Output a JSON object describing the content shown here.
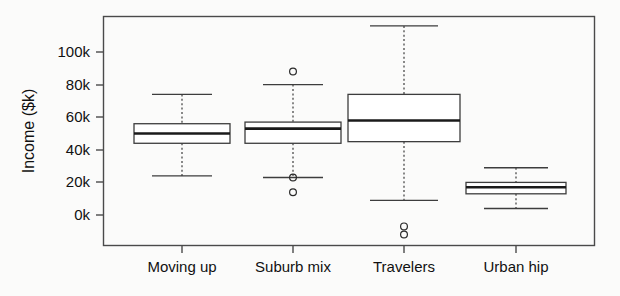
{
  "chart_data": {
    "type": "box",
    "title": "",
    "xlabel": "",
    "ylabel": "Income ($k)",
    "categories": [
      "Moving up",
      "Suburb mix",
      "Travelers",
      "Urban hip"
    ],
    "ylim": [
      -15000,
      120000
    ],
    "yticks": [
      0,
      20000,
      40000,
      60000,
      80000,
      100000
    ],
    "ytick_labels": [
      "0k",
      "20k",
      "40k",
      "60k",
      "80k",
      "100k"
    ],
    "grid": false,
    "legend": null,
    "boxes": [
      {
        "name": "Moving up",
        "whisker_low": 24000,
        "q1": 44000,
        "median": 50000,
        "q3": 56000,
        "whisker_high": 74000,
        "outliers": []
      },
      {
        "name": "Suburb mix",
        "whisker_low": 23000,
        "q1": 44000,
        "median": 53000,
        "q3": 57000,
        "whisker_high": 80000,
        "outliers": [
          88000,
          23000,
          14000
        ]
      },
      {
        "name": "Travelers",
        "whisker_low": 9000,
        "q1": 45000,
        "median": 58000,
        "q3": 74000,
        "whisker_high": 116000,
        "outliers": [
          -7000,
          -12000
        ]
      },
      {
        "name": "Urban hip",
        "whisker_low": 4000,
        "q1": 13000,
        "median": 17000,
        "q3": 20000,
        "whisker_high": 29000,
        "outliers": []
      }
    ]
  },
  "axes": {
    "y_label": "Income ($k)",
    "y_tick_labels": [
      "100k",
      "80k",
      "60k",
      "40k",
      "20k",
      "0k"
    ],
    "x_tick_labels": [
      "Moving up",
      "Suburb mix",
      "Travelers",
      "Urban hip"
    ]
  },
  "colors": {
    "background": "#fbfbfa",
    "frame": "#4a4a4a",
    "box_stroke": "#3d3d3d",
    "box_fill": "#ffffff",
    "median": "#1a1a1a",
    "text": "#111111"
  }
}
